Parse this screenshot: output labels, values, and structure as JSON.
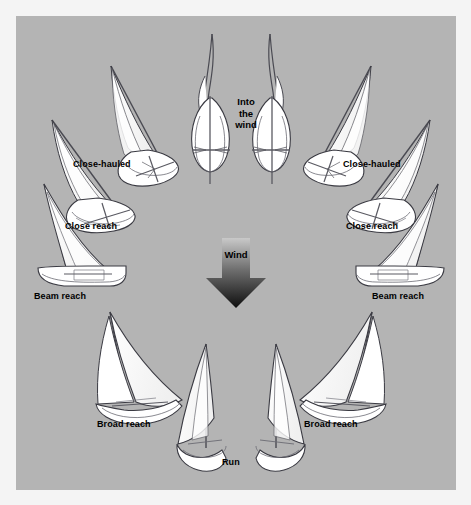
{
  "figure": {
    "kind": "points-of-sail-diagram",
    "background_color": "#f4f4f4",
    "panel_color": "#b4b4b4",
    "sail_fill": "#ffffff",
    "outline_color": "#3a3a42",
    "label_color": "#000000"
  },
  "wind": {
    "label": "Wind",
    "direction": "down",
    "arrow_gradient_top": "#cccccc",
    "arrow_gradient_bottom": "#111111"
  },
  "center": {
    "into_the_wind_label": "Into\nthe\nwind"
  },
  "points_of_sail": [
    {
      "id": "into-the-wind",
      "label": "Into\nthe\nwind",
      "side": "center",
      "boat_count": 2,
      "view": "head-on",
      "sails": "luffing"
    },
    {
      "id": "close-hauled-port",
      "label": "Close-hauled",
      "side": "left",
      "boat_count": 1,
      "view": "steep-from-astern",
      "sails": "sheeted-in-tight"
    },
    {
      "id": "close-hauled-starboard",
      "label": "Close-hauled",
      "side": "right",
      "boat_count": 1,
      "view": "steep-from-astern",
      "sails": "sheeted-in-tight"
    },
    {
      "id": "close-reach-port",
      "label": "Close reach",
      "side": "left",
      "boat_count": 1,
      "view": "three-quarter-astern",
      "sails": "eased-slightly"
    },
    {
      "id": "close-reach-starboard",
      "label": "Close reach",
      "side": "right",
      "boat_count": 1,
      "view": "three-quarter-astern",
      "sails": "eased-slightly"
    },
    {
      "id": "beam-reach-port",
      "label": "Beam reach",
      "side": "left",
      "boat_count": 1,
      "view": "broadside",
      "sails": "half-eased"
    },
    {
      "id": "beam-reach-starboard",
      "label": "Beam reach",
      "side": "right",
      "boat_count": 1,
      "view": "broadside",
      "sails": "half-eased"
    },
    {
      "id": "broad-reach-port",
      "label": "Broad reach",
      "side": "left",
      "boat_count": 1,
      "view": "from-astern-quarter",
      "sails": "well-eased"
    },
    {
      "id": "broad-reach-starboard",
      "label": "Broad reach",
      "side": "right",
      "boat_count": 1,
      "view": "from-astern-quarter",
      "sails": "well-eased"
    },
    {
      "id": "run",
      "label": "Run",
      "side": "center",
      "boat_count": 2,
      "view": "dead-astern",
      "sails": "squared-off"
    }
  ],
  "labels": {
    "close_hauled_left": "Close-hauled",
    "close_hauled_right": "Close-hauled",
    "close_reach_left": "Close reach",
    "close_reach_right": "Close reach",
    "beam_reach_left": "Beam reach",
    "beam_reach_right": "Beam reach",
    "broad_reach_left": "Broad reach",
    "broad_reach_right": "Broad reach",
    "run": "Run",
    "wind": "Wind",
    "into_the_wind": "Into\nthe\nwind"
  }
}
